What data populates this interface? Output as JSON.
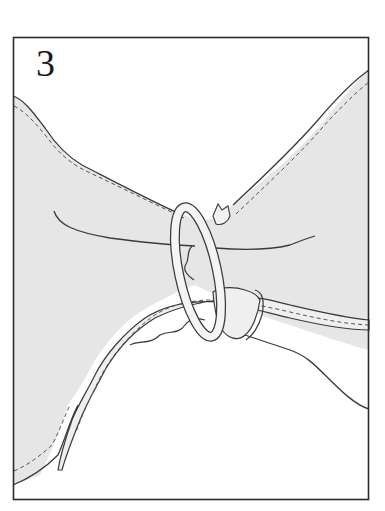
{
  "figure": {
    "step_number": "3",
    "colors": {
      "ink": "#3a3a3a",
      "fabric_fill": "#e6e6e6",
      "ring_fill": "#f4f4f4",
      "background": "#ffffff"
    }
  }
}
